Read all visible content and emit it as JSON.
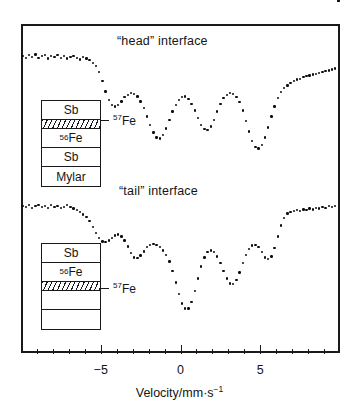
{
  "figure": {
    "x_axis_label_main": "Velocity/mm·s",
    "x_axis_label_exponent": "−1",
    "x_axis": {
      "min": -10,
      "max": 10,
      "major_ticks": [
        -5,
        0,
        5
      ],
      "major_tick_labels": [
        "−5",
        "0",
        "5"
      ],
      "minor_tick_step": 1
    }
  },
  "panels": {
    "head": {
      "title": "“head” interface"
    },
    "tail": {
      "title": "“tail” interface"
    }
  },
  "stacks": {
    "head": {
      "layers": [
        {
          "label": "Sb",
          "sup": "",
          "hatched": false,
          "thin": false
        },
        {
          "label": "",
          "sup": "",
          "hatched": true,
          "thin": true
        },
        {
          "label": "Fe",
          "sup": "56",
          "hatched": false,
          "thin": false
        },
        {
          "label": "Sb",
          "sup": "",
          "hatched": false,
          "thin": false
        },
        {
          "label": "Mylar",
          "sup": "",
          "hatched": false,
          "thin": false
        }
      ],
      "pointer_label_sup": "57",
      "pointer_label": "Fe"
    },
    "tail": {
      "layers": [
        {
          "label": "Sb",
          "sup": "",
          "hatched": false,
          "thin": false
        },
        {
          "label": "Fe",
          "sup": "56",
          "hatched": false,
          "thin": false
        },
        {
          "label": "",
          "sup": "",
          "hatched": true,
          "thin": true
        },
        {
          "label": "",
          "sup": "",
          "hatched": false,
          "thin": false
        },
        {
          "label": "",
          "sup": "",
          "hatched": false,
          "thin": false
        }
      ],
      "pointer_label_sup": "57",
      "pointer_label": "Fe"
    }
  },
  "chart_data": [
    {
      "type": "scatter",
      "title": "“head” interface",
      "xlabel": "Velocity/mm·s⁻¹",
      "ylabel": "Relative transmission",
      "xlim": [
        -10,
        10
      ],
      "ylim": [
        0.86,
        1.01
      ],
      "grid": false,
      "legend": null,
      "annotations": [
        "⁵⁷Fe"
      ],
      "series": [
        {
          "name": "head interface spectrum",
          "x": [
            -9.9,
            -9.7,
            -9.5,
            -9.3,
            -9.1,
            -8.9,
            -8.7,
            -8.5,
            -8.3,
            -8.1,
            -7.9,
            -7.7,
            -7.5,
            -7.3,
            -7.1,
            -6.9,
            -6.7,
            -6.5,
            -6.3,
            -6.1,
            -5.9,
            -5.7,
            -5.5,
            -5.3,
            -5.1,
            -4.9,
            -4.7,
            -4.5,
            -4.3,
            -4.1,
            -3.9,
            -3.7,
            -3.5,
            -3.3,
            -3.1,
            -2.9,
            -2.7,
            -2.5,
            -2.3,
            -2.1,
            -1.9,
            -1.7,
            -1.5,
            -1.3,
            -1.1,
            -0.9,
            -0.7,
            -0.5,
            -0.3,
            -0.1,
            0.1,
            0.3,
            0.5,
            0.7,
            0.9,
            1.1,
            1.3,
            1.5,
            1.7,
            1.9,
            2.1,
            2.3,
            2.5,
            2.7,
            2.9,
            3.1,
            3.3,
            3.5,
            3.7,
            3.9,
            4.1,
            4.3,
            4.5,
            4.7,
            4.9,
            5.1,
            5.3,
            5.5,
            5.7,
            5.9,
            6.1,
            6.3,
            6.5,
            6.7,
            6.9,
            7.1,
            7.3,
            7.5,
            7.7,
            7.9,
            8.1,
            8.3,
            8.5,
            8.7,
            8.9,
            9.1,
            9.3,
            9.5,
            9.7,
            9.9
          ],
          "y": [
            0.998,
            0.996,
            0.999,
            0.997,
            1.0,
            0.996,
            0.998,
            0.999,
            0.995,
            0.998,
            0.997,
            0.999,
            0.996,
            0.998,
            0.995,
            0.997,
            0.998,
            0.996,
            0.994,
            0.997,
            0.995,
            0.993,
            0.99,
            0.986,
            0.979,
            0.968,
            0.956,
            0.946,
            0.94,
            0.938,
            0.94,
            0.944,
            0.949,
            0.952,
            0.954,
            0.953,
            0.95,
            0.944,
            0.936,
            0.926,
            0.916,
            0.907,
            0.901,
            0.9,
            0.904,
            0.912,
            0.922,
            0.932,
            0.94,
            0.946,
            0.949,
            0.95,
            0.947,
            0.941,
            0.933,
            0.924,
            0.916,
            0.911,
            0.91,
            0.914,
            0.922,
            0.932,
            0.941,
            0.948,
            0.952,
            0.954,
            0.953,
            0.949,
            0.943,
            0.933,
            0.921,
            0.908,
            0.897,
            0.89,
            0.888,
            0.892,
            0.901,
            0.913,
            0.926,
            0.938,
            0.948,
            0.955,
            0.96,
            0.963,
            0.966,
            0.968,
            0.97,
            0.971,
            0.973,
            0.974,
            0.975,
            0.976,
            0.977,
            0.978,
            0.979,
            0.98,
            0.981,
            0.982,
            0.983
          ]
        }
      ]
    },
    {
      "type": "scatter",
      "title": "“tail” interface",
      "xlabel": "Velocity/mm·s⁻¹",
      "ylabel": "Relative transmission",
      "xlim": [
        -10,
        10
      ],
      "ylim": [
        0.86,
        1.01
      ],
      "grid": false,
      "legend": null,
      "annotations": [
        "⁵⁷Fe"
      ],
      "series": [
        {
          "name": "tail interface spectrum",
          "x": [
            -9.9,
            -9.7,
            -9.5,
            -9.3,
            -9.1,
            -8.9,
            -8.7,
            -8.5,
            -8.3,
            -8.1,
            -7.9,
            -7.7,
            -7.5,
            -7.3,
            -7.1,
            -6.9,
            -6.7,
            -6.5,
            -6.3,
            -6.1,
            -5.9,
            -5.7,
            -5.5,
            -5.3,
            -5.1,
            -4.9,
            -4.7,
            -4.5,
            -4.3,
            -4.1,
            -3.9,
            -3.7,
            -3.5,
            -3.3,
            -3.1,
            -2.9,
            -2.7,
            -2.5,
            -2.3,
            -2.1,
            -1.9,
            -1.7,
            -1.5,
            -1.3,
            -1.1,
            -0.9,
            -0.7,
            -0.5,
            -0.3,
            -0.1,
            0.1,
            0.3,
            0.5,
            0.7,
            0.9,
            1.1,
            1.3,
            1.5,
            1.7,
            1.9,
            2.1,
            2.3,
            2.5,
            2.7,
            2.9,
            3.1,
            3.3,
            3.5,
            3.7,
            3.9,
            4.1,
            4.3,
            4.5,
            4.7,
            4.9,
            5.1,
            5.3,
            5.5,
            5.7,
            5.9,
            6.1,
            6.3,
            6.5,
            6.7,
            6.9,
            7.1,
            7.3,
            7.5,
            7.7,
            7.9,
            8.1,
            8.3,
            8.5,
            8.7,
            8.9,
            9.1,
            9.3,
            9.5,
            9.7,
            9.9
          ],
          "y": [
            0.998,
            0.997,
            0.999,
            0.996,
            0.998,
            0.999,
            0.997,
            0.998,
            0.996,
            0.999,
            0.997,
            0.998,
            0.996,
            0.997,
            0.999,
            0.997,
            0.995,
            0.993,
            0.991,
            0.988,
            0.985,
            0.98,
            0.973,
            0.966,
            0.96,
            0.956,
            0.955,
            0.957,
            0.96,
            0.963,
            0.964,
            0.962,
            0.957,
            0.95,
            0.942,
            0.937,
            0.936,
            0.939,
            0.944,
            0.949,
            0.952,
            0.953,
            0.952,
            0.949,
            0.945,
            0.94,
            0.932,
            0.921,
            0.907,
            0.893,
            0.882,
            0.876,
            0.876,
            0.884,
            0.897,
            0.912,
            0.926,
            0.937,
            0.943,
            0.945,
            0.943,
            0.938,
            0.93,
            0.921,
            0.912,
            0.906,
            0.905,
            0.91,
            0.919,
            0.93,
            0.94,
            0.947,
            0.951,
            0.952,
            0.949,
            0.943,
            0.937,
            0.935,
            0.938,
            0.948,
            0.962,
            0.975,
            0.984,
            0.989,
            0.991,
            0.992,
            0.993,
            0.992,
            0.994,
            0.993,
            0.995,
            0.994,
            0.996,
            0.995,
            0.997,
            0.996,
            0.998,
            0.997,
            0.998
          ]
        }
      ]
    }
  ]
}
